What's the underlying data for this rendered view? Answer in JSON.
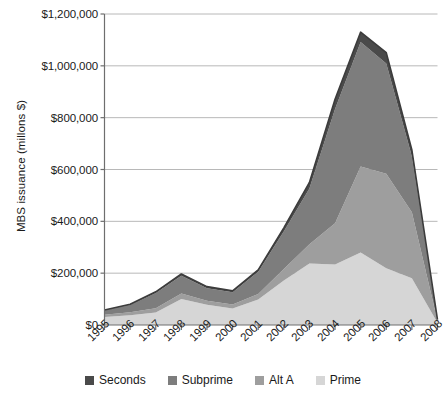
{
  "chart_data": {
    "type": "area",
    "stacked": true,
    "title": "",
    "xlabel": "",
    "ylabel": "MBS issuance (millons $)",
    "x": [
      1995,
      1996,
      1997,
      1998,
      1999,
      2000,
      2001,
      2002,
      2003,
      2004,
      2005,
      2006,
      2007,
      2008
    ],
    "categories": [
      "1995",
      "1996",
      "1997",
      "1998",
      "1999",
      "2000",
      "2001",
      "2002",
      "2003",
      "2004",
      "2005",
      "2006",
      "2007",
      "2008"
    ],
    "ylim": [
      0,
      1200000
    ],
    "yticks": [
      0,
      200000,
      400000,
      600000,
      800000,
      1000000,
      1200000
    ],
    "ytick_labels": [
      "$0",
      "$200,000",
      "$400,000",
      "$600,000",
      "$800,000",
      "$1,000,000",
      "$1,200,000"
    ],
    "grid": "horizontal",
    "legend_position": "bottom",
    "series_order_bottom_to_top": [
      "Prime",
      "Alt A",
      "Subprime",
      "Seconds"
    ],
    "series": [
      {
        "name": "Prime",
        "color": "#d6d6d6",
        "values": [
          31000,
          38000,
          48000,
          100000,
          78000,
          64000,
          98000,
          172000,
          237000,
          233000,
          280000,
          219000,
          180000,
          9000
        ]
      },
      {
        "name": "Alt A",
        "color": "#9e9e9e",
        "values": [
          9000,
          11000,
          17000,
          22000,
          16000,
          15000,
          22000,
          44000,
          75000,
          160000,
          332000,
          365000,
          255000,
          6000
        ]
      },
      {
        "name": "Subprime",
        "color": "#7d7d7d",
        "values": [
          16000,
          28000,
          58000,
          68000,
          48000,
          47000,
          85000,
          145000,
          215000,
          440000,
          480000,
          425000,
          215000,
          5000
        ]
      },
      {
        "name": "Seconds",
        "color": "#4a4a4a",
        "values": [
          2000,
          3000,
          5000,
          7000,
          6000,
          6000,
          8000,
          14000,
          23000,
          38000,
          38000,
          42000,
          25000,
          1000
        ]
      }
    ],
    "totals": [
      58000,
      80000,
      128000,
      197000,
      148000,
      132000,
      213000,
      375000,
      550000,
      871000,
      1130000,
      1051000,
      675000,
      21000
    ],
    "legend": [
      {
        "label": "Seconds",
        "color": "#4a4a4a"
      },
      {
        "label": "Subprime",
        "color": "#7d7d7d"
      },
      {
        "label": "Alt A",
        "color": "#9e9e9e"
      },
      {
        "label": "Prime",
        "color": "#d6d6d6"
      }
    ],
    "axis_color": "#6e6e6e",
    "grid_color": "#b8b8b8",
    "outline_color": "#3c3c3c"
  }
}
